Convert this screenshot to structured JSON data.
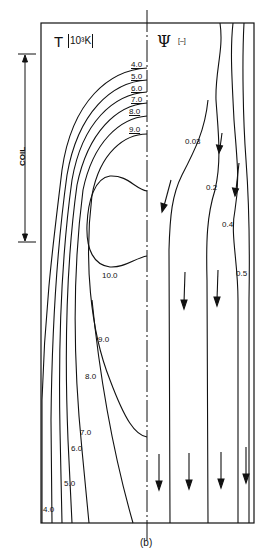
{
  "figure": {
    "caption": "(b)",
    "left_panel": {
      "variable": "T",
      "unit": "10³K",
      "contour_labels_top": [
        "4.0",
        "5.0",
        "6.0",
        "7.0",
        "8.0",
        "9.0"
      ],
      "contour_label_center": "10.0",
      "contour_labels_lower": [
        "9.0",
        "8.0",
        "7.0",
        "6.0",
        "5.0",
        "4.0"
      ]
    },
    "right_panel": {
      "variable": "Ψ",
      "unit": "[–]",
      "streamline_labels": [
        "0.03",
        "0.2",
        "0.4",
        "0.5"
      ]
    },
    "coil": {
      "label": "COIL"
    }
  }
}
